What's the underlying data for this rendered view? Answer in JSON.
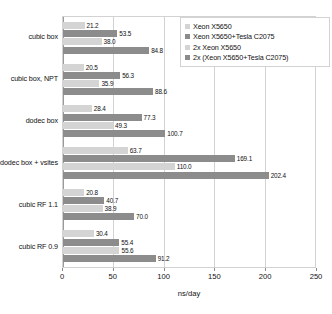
{
  "chart_data": {
    "type": "bar",
    "orientation": "horizontal",
    "title": "",
    "xlabel": "ns/day",
    "ylabel": "",
    "xlim": [
      0,
      250
    ],
    "xticks": [
      0,
      50,
      100,
      150,
      200,
      250
    ],
    "grid": true,
    "legend_position": "top-right",
    "categories": [
      "cubic box",
      "cubic box, NPT",
      "dodec box",
      "dodec box + vsites",
      "cubic RF 1.1",
      "cubic RF 0.9"
    ],
    "series": [
      {
        "name": "Xeon X5650",
        "color": "#d4d4d4",
        "values": [
          21.2,
          20.5,
          28.4,
          63.7,
          20.8,
          30.4
        ]
      },
      {
        "name": "Xeon X5650+Tesla C2075",
        "color": "#8c8c8c",
        "values": [
          53.5,
          56.3,
          77.3,
          169.1,
          40.7,
          55.4
        ]
      },
      {
        "name": "2x Xeon X5650",
        "color": "#d4d4d4",
        "values": [
          38.0,
          35.9,
          49.3,
          110.0,
          38.9,
          55.6
        ]
      },
      {
        "name": "2x (Xeon X5650+Tesla C2075)",
        "color": "#8c8c8c",
        "values": [
          84.8,
          88.6,
          100.7,
          202.4,
          70.0,
          91.2
        ]
      }
    ]
  }
}
